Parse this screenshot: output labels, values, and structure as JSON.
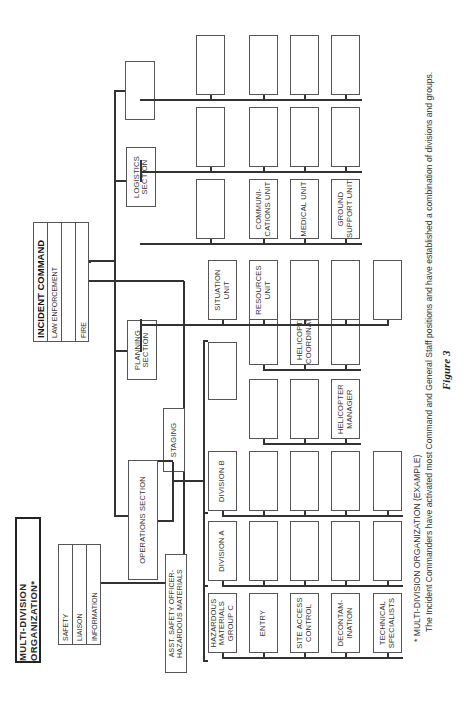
{
  "title": "MULTI-DIVISION ORGANIZATION*",
  "incident_command": {
    "rows": [
      "INCIDENT COMMAND",
      "LAW ENFORCEMENT",
      "",
      "FIRE"
    ]
  },
  "command_staff": {
    "rows": [
      "SAFETY",
      "LIAISON",
      "INFORMATION"
    ]
  },
  "asst_safety_officer": "ASST. SAFETY OFFICER-HAZARDOUS MATERIALS",
  "sections": {
    "operations": "OPERATIONS SECTION",
    "staging": "STAGING",
    "planning": "PLANNING SECTION",
    "logistics": "LOGISTICS SECTION",
    "unnamed_section": ""
  },
  "operations_columns": {
    "hazmat_group": [
      "HAZARDOUS MATERIALS GROUP C",
      "ENTRY",
      "SITE ACCESS CONTROL",
      "DECONTAM-INATION",
      "TECHNICAL SPECIALISTS"
    ],
    "division_a": [
      "DIVISION A",
      "",
      "",
      "",
      ""
    ],
    "division_b": [
      "DIVISION B",
      "",
      "",
      "",
      ""
    ],
    "air_ops": [
      "",
      "",
      "HELICOPTER MANAGER"
    ],
    "air_ops_2": [
      "",
      "HELICOPTER COORDINATOR",
      ""
    ]
  },
  "planning_units": [
    "SITUATION UNIT",
    "RESOURCES UNIT",
    "",
    "",
    ""
  ],
  "logistics_units_lower": [
    "",
    "COMMUNI-CATIONS UNIT",
    "MEDICAL UNIT",
    "GROUND SUPPORT UNIT"
  ],
  "logistics_units_upper": [
    "",
    "",
    "",
    ""
  ],
  "caption": {
    "line1": "* MULTI-DIVISION  ORGANIZATION (EXAMPLE)",
    "line2": "The Incident Commanders have activated most Command and General Staff positions and have established a combination of divisions and groups.",
    "figure": "Figure 3"
  }
}
